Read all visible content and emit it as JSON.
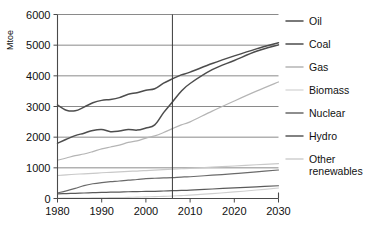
{
  "chart_data": {
    "type": "line",
    "title": "",
    "subtitle": "",
    "xlabel": "",
    "ylabel": "Mtoe",
    "xlim": [
      1980,
      2030
    ],
    "ylim": [
      0,
      6000
    ],
    "grid": true,
    "legend_position": "right",
    "xticks": [
      1980,
      1990,
      2000,
      2010,
      2020,
      2030
    ],
    "xtick_labels": [
      "1980",
      "1990",
      "2000",
      "2010",
      "2020",
      "2030"
    ],
    "yticks": [
      0,
      1000,
      2000,
      3000,
      4000,
      5000,
      6000
    ],
    "ytick_labels": [
      "0",
      "1000",
      "2000",
      "3000",
      "4000",
      "5000",
      "6000"
    ],
    "annotations": [
      {
        "name": "projection-divider",
        "type": "vline",
        "x": 2006,
        "label": ""
      }
    ],
    "x": [
      1980,
      1982,
      1984,
      1986,
      1988,
      1990,
      1992,
      1994,
      1996,
      1998,
      2000,
      2002,
      2004,
      2006,
      2008,
      2010,
      2015,
      2020,
      2025,
      2030
    ],
    "series": [
      {
        "name": "Oil",
        "color": "#4d4d4d",
        "width": 1.5,
        "values": [
          3050,
          2880,
          2860,
          2980,
          3120,
          3200,
          3230,
          3290,
          3400,
          3450,
          3530,
          3580,
          3760,
          3900,
          4030,
          4120,
          4400,
          4650,
          4880,
          5080
        ]
      },
      {
        "name": "Coal",
        "color": "#4d4d4d",
        "width": 1.5,
        "values": [
          1800,
          1930,
          2050,
          2130,
          2220,
          2250,
          2180,
          2200,
          2250,
          2230,
          2300,
          2400,
          2800,
          3150,
          3500,
          3750,
          4200,
          4500,
          4800,
          5010
        ]
      },
      {
        "name": "Gas",
        "color": "#b5b5b5",
        "width": 1.2,
        "values": [
          1250,
          1320,
          1400,
          1450,
          1530,
          1620,
          1680,
          1740,
          1830,
          1880,
          1970,
          2040,
          2150,
          2280,
          2400,
          2500,
          2850,
          3180,
          3500,
          3800
        ]
      },
      {
        "name": "Biomass",
        "color": "#c9c9c9",
        "width": 1.2,
        "values": [
          750,
          770,
          790,
          805,
          820,
          840,
          855,
          870,
          885,
          895,
          910,
          925,
          940,
          955,
          970,
          985,
          1020,
          1060,
          1100,
          1140
        ]
      },
      {
        "name": "Nuclear",
        "color": "#6a6a6a",
        "width": 1.2,
        "values": [
          180,
          250,
          330,
          420,
          480,
          520,
          550,
          570,
          600,
          620,
          650,
          660,
          670,
          680,
          700,
          710,
          760,
          810,
          870,
          930
        ]
      },
      {
        "name": "Hydro",
        "color": "#5a5a5a",
        "width": 1.2,
        "values": [
          150,
          160,
          170,
          180,
          190,
          200,
          205,
          210,
          220,
          225,
          230,
          235,
          245,
          255,
          265,
          275,
          310,
          345,
          380,
          415
        ]
      },
      {
        "name": "Other renewables",
        "color": "#cfcfcf",
        "width": 1.1,
        "values": [
          10,
          12,
          14,
          17,
          20,
          24,
          28,
          32,
          38,
          45,
          52,
          60,
          70,
          82,
          95,
          110,
          160,
          215,
          275,
          340
        ]
      }
    ]
  },
  "legend": {
    "entries": [
      {
        "label": "Oil",
        "color": "#4d4d4d"
      },
      {
        "label": "Coal",
        "color": "#4d4d4d"
      },
      {
        "label": "Gas",
        "color": "#b5b5b5"
      },
      {
        "label": "Biomass",
        "color": "#dcdcdc"
      },
      {
        "label": "Nuclear",
        "color": "#6a6a6a"
      },
      {
        "label": "Hydro",
        "color": "#5a5a5a"
      },
      {
        "label": "Other renewables",
        "color": "#cfcfcf"
      }
    ]
  }
}
